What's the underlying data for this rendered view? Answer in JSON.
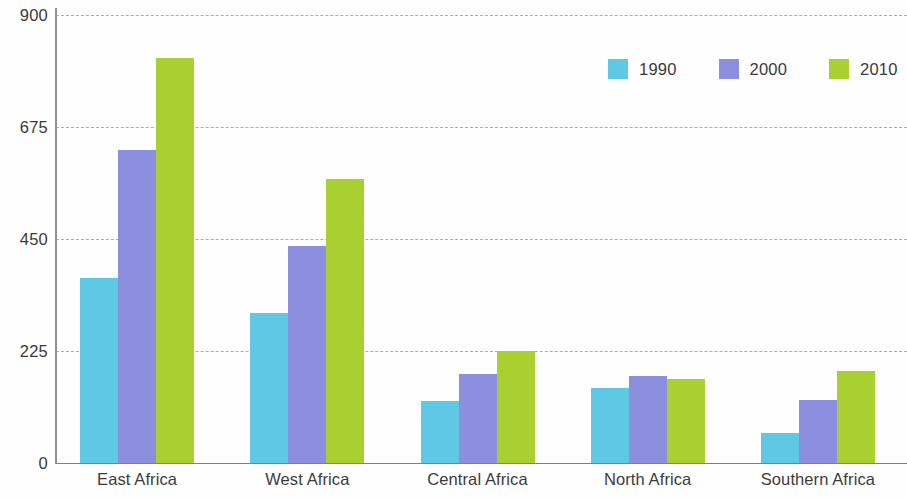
{
  "chart_data": {
    "type": "bar",
    "title": "",
    "subtitle": "",
    "xlabel": "",
    "ylabel": "",
    "categories": [
      "East Africa",
      "West Africa",
      "Central Africa",
      "North Africa",
      "Southern Africa"
    ],
    "series": [
      {
        "name": "1990",
        "color": "#5fc8e4",
        "values": [
          372,
          301,
          125,
          151,
          60
        ]
      },
      {
        "name": "2000",
        "color": "#8b8fde",
        "values": [
          629,
          436,
          179,
          175,
          127
        ]
      },
      {
        "name": "2010",
        "color": "#a9d030",
        "values": [
          814,
          570,
          225,
          169,
          185
        ]
      }
    ],
    "ylim": [
      0,
      900
    ],
    "yticks": [
      0,
      225,
      450,
      675,
      900
    ],
    "ytick_labels": [
      "0",
      "225",
      "450",
      "675",
      "900"
    ],
    "grid": true,
    "grid_style": "dashed",
    "grid_axis": "y",
    "legend_position": "top-right",
    "legend_orientation": "horizontal",
    "annotations": []
  },
  "colors": {
    "series_1990": "#5fc8e4",
    "series_2000": "#8b8fde",
    "series_2010": "#a9d030",
    "gridline": "#9aa0a6",
    "axis": "#7b8186",
    "text": "#3a3a3a",
    "background": "#fefefe"
  }
}
